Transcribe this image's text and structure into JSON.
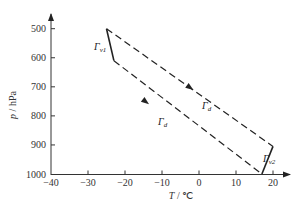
{
  "chart_data": {
    "type": "line",
    "title": "",
    "xlabel": "T / ℃",
    "ylabel": "p / hPa",
    "xlim": [
      -40,
      25
    ],
    "ylim": [
      1000,
      470
    ],
    "y_inverted": true,
    "grid": false,
    "x_ticks": [
      -40,
      -30,
      -20,
      -10,
      0,
      10,
      20
    ],
    "y_ticks": [
      500,
      600,
      700,
      800,
      900,
      1000
    ],
    "x_tick_labels": [
      "-40",
      "-30",
      "-20",
      "-10",
      "0",
      "10",
      "20"
    ],
    "y_tick_labels": [
      "500",
      "600",
      "700",
      "800",
      "900",
      "1000"
    ],
    "series": [
      {
        "name": "Γd (upper)",
        "style": "dashed",
        "points": [
          {
            "T": -25,
            "p": 500
          },
          {
            "T": 20,
            "p": 905
          }
        ]
      },
      {
        "name": "Γd (lower)",
        "style": "dashed",
        "points": [
          {
            "T": -23,
            "p": 610
          },
          {
            "T": 17,
            "p": 1000
          }
        ]
      },
      {
        "name": "Γv1",
        "style": "solid",
        "points": [
          {
            "T": -25,
            "p": 500
          },
          {
            "T": -23,
            "p": 610
          }
        ]
      },
      {
        "name": "Γv2",
        "style": "solid",
        "points": [
          {
            "T": 17,
            "p": 1000
          },
          {
            "T": 20,
            "p": 905
          }
        ]
      }
    ],
    "annotations": [
      {
        "text": "Γv1",
        "near": {
          "T": -28,
          "p": 560
        }
      },
      {
        "text": "Γd",
        "near": {
          "T": 0,
          "p": 715
        },
        "arrow_direction": "down-right"
      },
      {
        "text": "Γd",
        "near": {
          "T": -12,
          "p": 810
        },
        "arrow_direction": "down-right"
      },
      {
        "text": "Γv2",
        "near": {
          "T": 21,
          "p": 950
        }
      }
    ]
  },
  "labels": {
    "xlabel_italic": "T",
    "xlabel_unit": " / ℃",
    "ylabel_italic": "p",
    "ylabel_unit": " / hPa",
    "gamma": "Γ",
    "sub_v1": "v1",
    "sub_v2": "v2",
    "sub_d": "d"
  }
}
